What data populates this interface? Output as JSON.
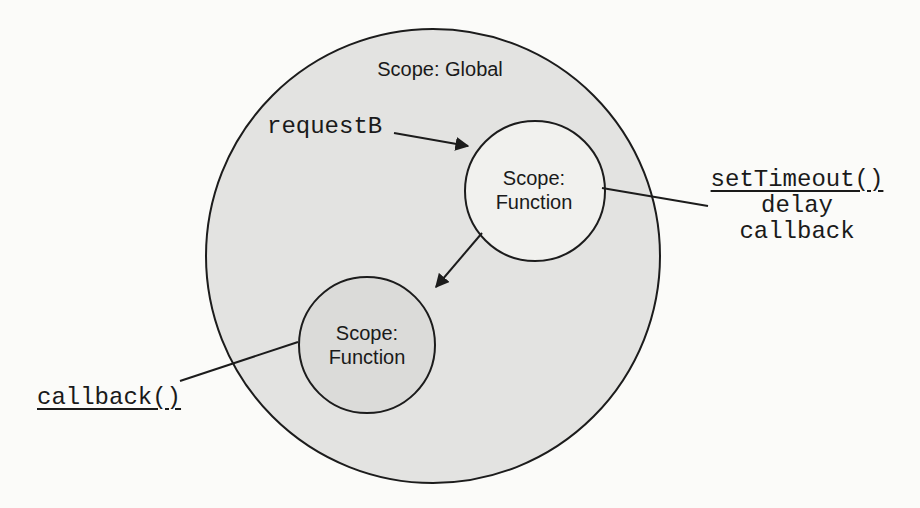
{
  "figure": {
    "global_scope_label": "Scope: Global",
    "top_function_scope": {
      "line1": "Scope:",
      "line2": "Function"
    },
    "bottom_function_scope": {
      "line1": "Scope:",
      "line2": "Function"
    },
    "request_label": "requestB",
    "settimeout_block": {
      "title": "setTimeout()",
      "arg_delay": "delay",
      "arg_callback": "callback"
    },
    "callback_label": "callback()"
  },
  "colors": {
    "global_scope_fill": "#e3e3e1",
    "top_function_scope_fill": "#f1f1ee",
    "bottom_function_scope_fill": "#dbdbd9",
    "stroke": "#1c1c1c"
  }
}
